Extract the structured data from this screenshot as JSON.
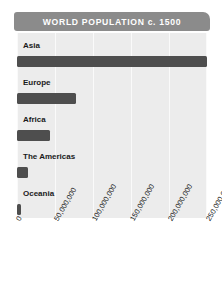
{
  "chart_data": {
    "type": "bar",
    "orientation": "horizontal",
    "title": "WORLD POPULATION c. 1500",
    "xlabel": "",
    "ylabel": "",
    "categories": [
      "Asia",
      "Europe",
      "Africa",
      "The Americas",
      "Oceania"
    ],
    "values": [
      250000000,
      77000000,
      44000000,
      14000000,
      3000000
    ],
    "xlim": [
      0,
      250000000
    ],
    "xticks": [
      0,
      50000000,
      100000000,
      150000000,
      200000000,
      250000000
    ],
    "xtick_labels": [
      "0",
      "50,000,000",
      "100,000,000",
      "150,000,000",
      "200,000,000",
      "250,000,000"
    ],
    "grid": true,
    "legend": false,
    "colors": {
      "bar": "#4e4e4e",
      "title_banner": "#8b8b8b",
      "title_text": "#ffffff",
      "plot_background": "#ececec",
      "gridline": "#fafafa",
      "page_background": "#ffffff",
      "label_text": "#1a1a1a"
    }
  }
}
